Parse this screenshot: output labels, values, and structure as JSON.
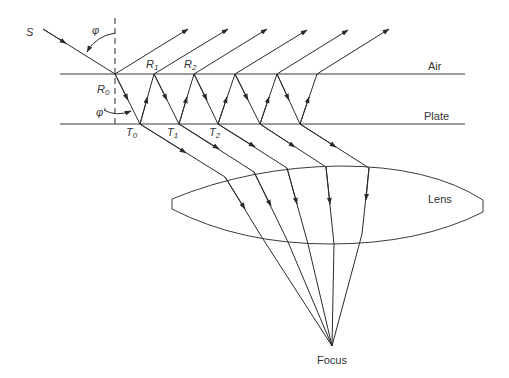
{
  "diagram": {
    "colors": {
      "stroke": "#2a2a2a",
      "text": "#333333",
      "background": "#ffffff"
    },
    "labels": {
      "source": "S",
      "phi": "φ",
      "phi_prime": "φ'",
      "air": "Air",
      "plate": "Plate",
      "lens": "Lens",
      "focus": "Focus",
      "reflection_points": [
        {
          "letter": "R",
          "sub": "0"
        },
        {
          "letter": "R",
          "sub": "1"
        },
        {
          "letter": "R",
          "sub": "2"
        }
      ],
      "transmission_points": [
        {
          "letter": "T",
          "sub": "0"
        },
        {
          "letter": "T",
          "sub": "1"
        },
        {
          "letter": "T",
          "sub": "2"
        }
      ]
    },
    "geometry": {
      "top_surface_y": 74,
      "bottom_surface_y": 124,
      "surface_x_range": [
        60,
        465
      ],
      "source_start": [
        43,
        29
      ],
      "top_hits_x": [
        115,
        154,
        194,
        235,
        277,
        317
      ],
      "bottom_hits_x": [
        140,
        179,
        218,
        260,
        300
      ],
      "reflected_end_x": [
        188,
        228,
        267,
        307,
        348,
        389
      ],
      "reflected_end_y": 29,
      "lens_entry": [
        [
          225,
          177
        ],
        [
          254,
          172
        ],
        [
          287,
          168
        ],
        [
          326,
          167
        ],
        [
          369,
          168
        ]
      ],
      "lens_exit": [
        [
          263,
          239
        ],
        [
          288,
          242
        ],
        [
          308,
          244
        ],
        [
          334,
          243
        ],
        [
          362,
          234
        ]
      ],
      "focus_point": [
        332,
        346
      ]
    }
  }
}
